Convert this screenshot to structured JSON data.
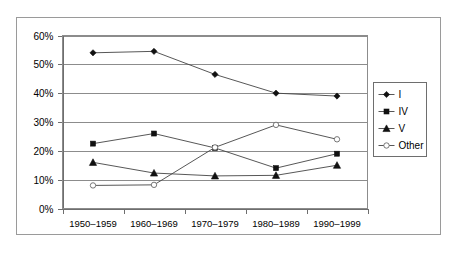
{
  "chart_data": {
    "type": "line",
    "title": "",
    "xlabel": "",
    "ylabel": "",
    "ylim": [
      0,
      60
    ],
    "ytick_labels": [
      "0%",
      "10%",
      "20%",
      "30%",
      "40%",
      "50%",
      "60%"
    ],
    "ytick_values": [
      0,
      10,
      20,
      30,
      40,
      50,
      60
    ],
    "grid": true,
    "legend_position": "right",
    "categories": [
      "1950–1959",
      "1960–1969",
      "1970–1979",
      "1980–1989",
      "1990–1999"
    ],
    "series": [
      {
        "name": "I",
        "marker": "diamond",
        "values": [
          54,
          54.5,
          46.5,
          40,
          39
        ]
      },
      {
        "name": "IV",
        "marker": "square",
        "values": [
          22.5,
          26,
          21,
          14,
          19
        ]
      },
      {
        "name": "V",
        "marker": "triangle",
        "values": [
          16,
          12.3,
          11.3,
          11.5,
          15
        ]
      },
      {
        "name": "Other",
        "marker": "open-circle",
        "values": [
          8,
          8.2,
          21.2,
          29,
          24
        ]
      }
    ]
  },
  "legend": {
    "entries": [
      {
        "label": "I"
      },
      {
        "label": "IV"
      },
      {
        "label": "V"
      },
      {
        "label": "Other"
      }
    ]
  },
  "colors": {
    "line": "#444444",
    "marker_solid": "#111111",
    "marker_open_stroke": "#6a6a6a",
    "grid": "#8c8c8c",
    "frame": "#9a9a9a",
    "background": "#ffffff"
  }
}
